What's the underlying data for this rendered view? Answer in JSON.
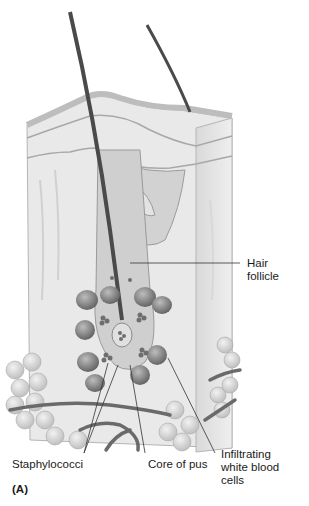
{
  "figure": {
    "panel_label": "(A)",
    "labels": {
      "hair_follicle": "Hair\nfollicle",
      "staphylococci": "Staphylococci",
      "core_of_pus": "Core of pus",
      "infiltrating_wbc": "Infiltrating\nwhite blood\ncells"
    },
    "colors": {
      "background": "#ffffff",
      "skin_light": "#ebebeb",
      "skin_mid": "#d6d6d6",
      "skin_dark": "#bdbdbd",
      "hair": "#4a4a4a",
      "bacteria": "#6e6e6e",
      "wbc": "#8c8c8c",
      "fat_cells": "#cfcfcf",
      "vessels": "#6a6a6a",
      "leader_line": "#333333"
    }
  }
}
